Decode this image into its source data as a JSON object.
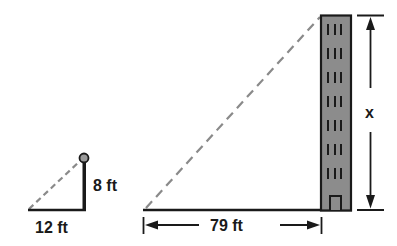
{
  "diagram": {
    "type": "similar-triangles-shadow",
    "small_triangle": {
      "height_label": "8 ft",
      "base_label": "12 ft"
    },
    "large_triangle": {
      "base_label": "79 ft",
      "height_label": "x"
    },
    "colors": {
      "line": "#1a1a1a",
      "dashed": "#8a8a8a",
      "building_fill": "#8c8c8c",
      "ball_fill": "#9a9a9a"
    }
  }
}
